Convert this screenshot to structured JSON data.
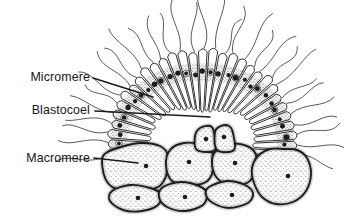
{
  "figure": {
    "type": "blastula cross-section diagram",
    "background": "#ffffff",
    "ink": "#1d1d1d",
    "labels": [
      {
        "id": "micromere",
        "text": "Micromere",
        "leader": [
          [
            93,
            78
          ],
          [
            153,
            97
          ]
        ]
      },
      {
        "id": "blastocoel",
        "text": "Blastocoel",
        "leader": [
          [
            95,
            111
          ],
          [
            210,
            117
          ]
        ]
      },
      {
        "id": "macromere",
        "text": "Macromere",
        "leader": [
          [
            94,
            158
          ],
          [
            138,
            163
          ]
        ]
      }
    ]
  }
}
